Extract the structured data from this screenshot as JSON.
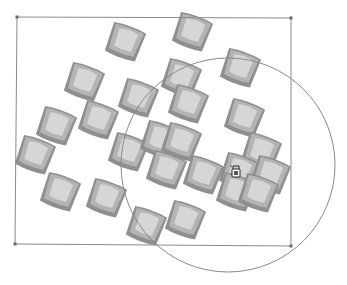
{
  "canvas": {
    "width": 347,
    "height": 285,
    "background": "#ffffff"
  },
  "selection_rect": {
    "corners": [
      [
        17,
        17
      ],
      [
        291,
        18
      ],
      [
        291,
        246
      ],
      [
        15,
        244
      ]
    ],
    "stroke": "#8a8a8a"
  },
  "selection_circle": {
    "cx": 228,
    "cy": 165,
    "r": 107,
    "stroke": "#8a8a8a"
  },
  "tiles": {
    "rotation_deg": 20,
    "colors": {
      "outer": "#8f8f8f",
      "mid": "#b4b4b4",
      "inner": "#d6d6d6"
    },
    "items": [
      {
        "x": 125,
        "y": 42
      },
      {
        "x": 192,
        "y": 32
      },
      {
        "x": 84,
        "y": 82
      },
      {
        "x": 181,
        "y": 78
      },
      {
        "x": 240,
        "y": 68
      },
      {
        "x": 138,
        "y": 98
      },
      {
        "x": 188,
        "y": 104
      },
      {
        "x": 98,
        "y": 120
      },
      {
        "x": 56,
        "y": 126
      },
      {
        "x": 244,
        "y": 118
      },
      {
        "x": 35,
        "y": 155
      },
      {
        "x": 128,
        "y": 152
      },
      {
        "x": 160,
        "y": 140
      },
      {
        "x": 181,
        "y": 142
      },
      {
        "x": 261,
        "y": 152
      },
      {
        "x": 166,
        "y": 170
      },
      {
        "x": 203,
        "y": 175
      },
      {
        "x": 239,
        "y": 172
      },
      {
        "x": 270,
        "y": 175
      },
      {
        "x": 60,
        "y": 192
      },
      {
        "x": 106,
        "y": 198
      },
      {
        "x": 236,
        "y": 192
      },
      {
        "x": 258,
        "y": 193
      },
      {
        "x": 146,
        "y": 226
      },
      {
        "x": 185,
        "y": 220
      }
    ]
  },
  "cursor": {
    "icon": "paint-bucket-cursor-icon",
    "x": 236,
    "y": 172
  }
}
